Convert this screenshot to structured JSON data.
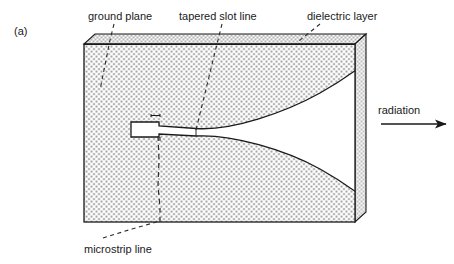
{
  "figure": {
    "panel_label": "(a)",
    "labels": {
      "ground_plane": "ground plane",
      "tapered_slot_line": "tapered slot line",
      "dielectric_layer": "dielectric layer",
      "radiation": "radiation",
      "microstrip_line": "microstrip line"
    },
    "colors": {
      "line": "#1a1a1a",
      "stipple_dot": "#4d4d4d",
      "dielectric_fill": "#ffffff",
      "slot_fill": "#ffffff",
      "side_face_fill": "#f2f2f2",
      "background": "#ffffff",
      "text": "#1a1a1a"
    },
    "geometry": {
      "front_face": {
        "x": 84,
        "y": 44,
        "width": 271,
        "height": 178
      },
      "depth_offset": {
        "dx": 11,
        "dy": -10
      },
      "ground_plane_strip": {
        "x": 84,
        "y": 36,
        "width": 271,
        "height": 9
      },
      "slot_throat": {
        "x": 131,
        "y": 122,
        "width": 28,
        "height": 15
      },
      "taper_mouth_top_y": 70,
      "taper_mouth_bottom_y": 192,
      "taper_start_x": 196,
      "taper_end_x": 355,
      "radiation_arrow": {
        "x1": 381,
        "y1": 124,
        "x2": 448,
        "y2": 124
      }
    },
    "leaders": {
      "ground_plane": {
        "from": [
          114,
          24
        ],
        "to": [
          100,
          90
        ]
      },
      "tapered_slot_line": {
        "from": [
          222,
          24
        ],
        "to": [
          196,
          130
        ]
      },
      "dielectric_layer": {
        "from": [
          319,
          24
        ],
        "to": [
          299,
          40
        ]
      },
      "microstrip_line": {
        "from": [
          103,
          238
        ],
        "to": [
          160,
          221
        ]
      }
    }
  }
}
